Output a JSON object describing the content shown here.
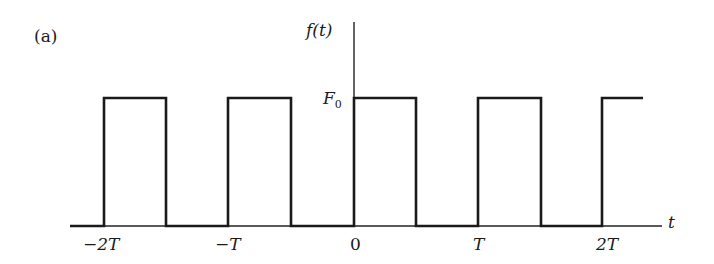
{
  "figure": {
    "panel_label": "(a)",
    "y_axis_label": "f(t)",
    "x_axis_label": "t",
    "level_label": "F",
    "level_subscript": "0",
    "x_ticks": [
      "−2T",
      "−T",
      "0",
      "T",
      "2T"
    ]
  },
  "waveform": {
    "type": "periodic square wave",
    "low": 0,
    "high": "F0",
    "period": "T",
    "line_color": "#1a1a1a",
    "rising_edges_px": [
      104,
      228,
      354,
      478,
      602
    ],
    "falling_edges_px": [
      166,
      291,
      416,
      541
    ]
  }
}
